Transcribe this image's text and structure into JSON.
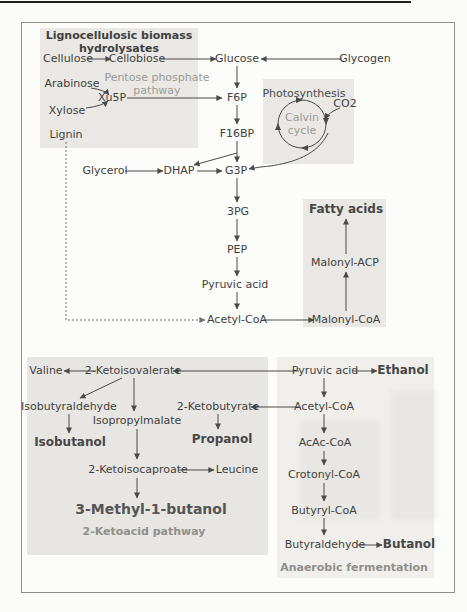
{
  "figure": {
    "biomass_box": {
      "title": "Lignocellulosic biomass\nhydrolysates",
      "pathway_label": "Pentose phosphate\npathway",
      "nodes": {
        "cellulose": "Cellulose",
        "cellobiose": "Cellobiose",
        "arabinose": "Arabinose",
        "xu5p": "Xu5P",
        "xylose": "Xylose",
        "lignin": "Lignin"
      }
    },
    "main_pathway": {
      "nodes": {
        "glucose": "Glucose",
        "glycogen": "Glycogen",
        "f6p": "F6P",
        "f16bp": "F16BP",
        "glycerol": "Glycerol",
        "dhap": "DHAP",
        "g3p": "G3P",
        "pg3": "3PG",
        "pep": "PEP",
        "pyruvic_acid": "Pyruvic acid",
        "acetyl_coa": "Acetyl-CoA"
      }
    },
    "photosynthesis_box": {
      "title": "Photosynthesis",
      "cycle_label": "Calvin\ncycle",
      "co2": "CO2"
    },
    "fatty_acids_box": {
      "title": "Fatty acids",
      "nodes": {
        "malonyl_acp": "Malonyl-ACP",
        "malonyl_coa": "Malonyl-CoA"
      }
    },
    "ketoacid_box": {
      "footer": "2-Ketoacid pathway",
      "nodes": {
        "valine": "Valine",
        "ketoisovalerate": "2-Ketoisovalerate",
        "isobutyraldehyde": "Isobutyraldehyde",
        "isopropylmalate": "Isopropylmalate",
        "isobutanol": "Isobutanol",
        "ketobutyrate": "2-Ketobutyrate",
        "propanol": "Propanol",
        "ketoisocaproate": "2-Ketoisocaproate",
        "leucine": "Leucine",
        "methylbutanol": "3-Methyl-1-butanol"
      }
    },
    "fermentation_box": {
      "footer": "Anaerobic fermentation",
      "nodes": {
        "pyruvic_acid": "Pyruvic acid",
        "ethanol": "Ethanol",
        "acetyl_coa": "Acetyl-CoA",
        "acac_coa": "AcAc-CoA",
        "crotonyl_coa": "Crotonyl-CoA",
        "butyryl_coa": "Butyryl-CoA",
        "butyraldehyde": "Butyraldehyde",
        "butanol": "Butanol"
      }
    },
    "colors": {
      "box_fill": "#e9e8e4",
      "light_box_fill": "#f0efeb",
      "text": "#3f3f3f",
      "muted_text": "#9b9b97",
      "arrow": "#4a4a4a",
      "frame_border": "#8f8f8f"
    }
  }
}
